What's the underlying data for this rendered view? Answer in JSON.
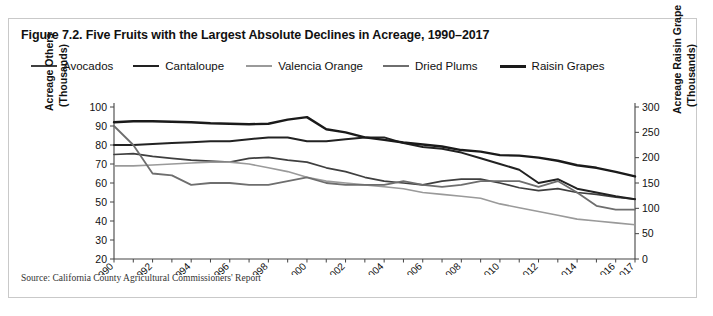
{
  "figure": {
    "title": "Figure 7.2. Five Fruits with the Largest Absolute Declines in Acreage, 1990–2017",
    "source": "Source: California County Agricultural Commissioners' Report",
    "border_color": "#c9c9c9",
    "background": "#ffffff"
  },
  "axis_labels": {
    "left_line1": "Acreage Others",
    "left_line2": "(Thousands)",
    "right_line1": "Acreage Raisin Grape",
    "right_line2": "(Thousands)"
  },
  "chart_data": {
    "type": "line",
    "title": "Figure 7.2. Five Fruits with the Largest Absolute Declines in Acreage, 1990–2017",
    "xlabel": "",
    "ylabel": "Acreage Others (Thousands)",
    "y2label": "Acreage Raisin Grape (Thousands)",
    "grid": false,
    "legend_position": "top",
    "x": [
      1990,
      1991,
      1992,
      1993,
      1994,
      1995,
      1996,
      1997,
      1998,
      1999,
      2000,
      2001,
      2002,
      2003,
      2004,
      2005,
      2006,
      2007,
      2008,
      2009,
      2010,
      2011,
      2012,
      2013,
      2014,
      2015,
      2016,
      2017
    ],
    "xtick_labels": [
      "1990",
      "1992",
      "1994",
      "1996",
      "1998",
      "2000",
      "2002",
      "2004",
      "2006",
      "2008",
      "2010",
      "2012",
      "2014",
      "2016",
      "2017"
    ],
    "ylim": [
      20,
      100
    ],
    "yticks": [
      20,
      30,
      40,
      50,
      60,
      70,
      80,
      90,
      100
    ],
    "y2lim": [
      0,
      300
    ],
    "y2ticks": [
      0,
      50,
      100,
      150,
      200,
      250,
      300
    ],
    "series": [
      {
        "name": "Avocados",
        "axis": "left",
        "color": "#3f3f3f",
        "width": 1.7,
        "values": [
          75,
          75.5,
          74,
          73,
          72,
          71.5,
          71,
          73,
          73.5,
          72,
          71,
          68,
          66,
          63,
          61,
          60,
          59,
          61,
          62,
          62,
          60,
          57.5,
          56,
          57,
          55,
          54,
          52.5,
          51.5
        ]
      },
      {
        "name": "Cantaloupe",
        "axis": "left",
        "color": "#222222",
        "width": 2.0,
        "values": [
          80,
          80,
          80.5,
          81,
          81.5,
          82,
          82,
          83,
          84,
          84,
          82,
          82,
          83,
          84,
          84,
          81,
          79,
          78,
          76,
          73,
          70,
          67,
          60,
          62,
          57,
          55,
          53,
          51.5
        ]
      },
      {
        "name": "Valencia Orange",
        "axis": "left",
        "color": "#9a9a9a",
        "width": 1.6,
        "values": [
          69,
          69,
          69.5,
          70,
          70.5,
          71,
          71,
          70,
          68,
          66,
          63,
          61,
          60,
          59,
          58,
          57,
          55,
          54,
          53,
          52,
          49,
          47,
          45,
          43,
          41,
          40,
          39,
          38
        ]
      },
      {
        "name": "Dried Plums",
        "axis": "left",
        "color": "#6e6e6e",
        "width": 1.8,
        "values": [
          90,
          80,
          65,
          64,
          59,
          60,
          60,
          59,
          59,
          61,
          63,
          60,
          59,
          59,
          59,
          61,
          59,
          58,
          59,
          61,
          61,
          61,
          58,
          61,
          55,
          48,
          46,
          46
        ]
      },
      {
        "name": "Raisin Grapes",
        "axis": "right",
        "color": "#1a1a1a",
        "width": 2.4,
        "values": [
          270,
          272,
          272,
          271,
          270,
          268,
          267,
          266,
          267,
          275,
          280,
          256,
          250,
          240,
          235,
          230,
          226,
          222,
          215,
          212,
          205,
          204,
          200,
          194,
          185,
          180,
          172,
          163
        ]
      }
    ]
  },
  "legend": [
    {
      "label": "Avocados",
      "color": "#3f3f3f",
      "width": 2.2
    },
    {
      "label": "Cantaloupe",
      "color": "#222222",
      "width": 2.8
    },
    {
      "label": "Valencia Orange",
      "color": "#9a9a9a",
      "width": 2.2
    },
    {
      "label": "Dried Plums",
      "color": "#6e6e6e",
      "width": 2.4
    },
    {
      "label": "Raisin Grapes",
      "color": "#1a1a1a",
      "width": 3.2
    }
  ]
}
